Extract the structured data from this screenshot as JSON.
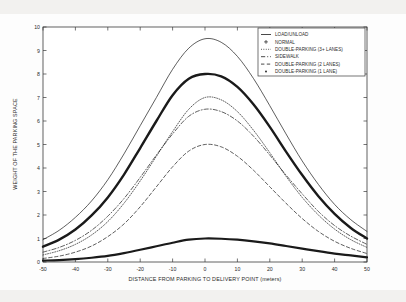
{
  "chart_data": {
    "type": "line",
    "title": "",
    "xlabel": "DISTANCE FROM PARKING TO DELIVERY POINT (meters)",
    "ylabel": "WEIGHT OF THE PARKING SPACE",
    "xlim": [
      -50,
      50
    ],
    "ylim": [
      0,
      10
    ],
    "xticks": [
      -50,
      -40,
      -30,
      -20,
      -10,
      0,
      10,
      20,
      30,
      40,
      50
    ],
    "yticks": [
      0,
      1,
      2,
      3,
      4,
      5,
      6,
      7,
      8,
      9,
      10
    ],
    "xtick_labels": [
      "-50",
      "-40",
      "-30",
      "-20",
      "-10",
      "0",
      "10",
      "20",
      "30",
      "40",
      "50"
    ],
    "ytick_labels": [
      "0",
      "1",
      "2",
      "3",
      "4",
      "5",
      "6",
      "7",
      "8",
      "9",
      "10"
    ],
    "grid": false,
    "legend_position": "top-right",
    "x": [
      -50,
      -45,
      -40,
      -35,
      -30,
      -25,
      -20,
      -15,
      -10,
      -5,
      0,
      5,
      10,
      15,
      20,
      25,
      30,
      35,
      40,
      45,
      50
    ],
    "series": [
      {
        "name": "LOAD/UNLOAD",
        "style": "solid",
        "linewidth": 0.7,
        "peak": 9.5,
        "values": [
          0.95,
          1.35,
          1.9,
          2.6,
          3.5,
          4.6,
          5.8,
          7.0,
          8.2,
          9.1,
          9.5,
          9.35,
          8.75,
          7.8,
          6.65,
          5.45,
          4.3,
          3.3,
          2.45,
          1.8,
          1.3
        ]
      },
      {
        "name": "NORMAL",
        "style": "solid",
        "linewidth": 2.2,
        "peak": 1.0,
        "values": [
          0.06,
          0.08,
          0.12,
          0.18,
          0.26,
          0.38,
          0.52,
          0.67,
          0.82,
          0.95,
          1.0,
          0.99,
          0.95,
          0.88,
          0.79,
          0.68,
          0.57,
          0.46,
          0.36,
          0.28,
          0.2
        ]
      },
      {
        "name": "DOUBLE-PARKING (3+ LANES)",
        "style": "dotted",
        "linewidth": 0.7,
        "peak": 7.0,
        "values": [
          0.3,
          0.48,
          0.75,
          1.15,
          1.72,
          2.5,
          3.45,
          4.5,
          5.55,
          6.5,
          7.0,
          6.9,
          6.4,
          5.6,
          4.65,
          3.65,
          2.75,
          2.0,
          1.4,
          0.95,
          0.62
        ]
      },
      {
        "name": "SIDEWALK",
        "style": "dashdot",
        "linewidth": 0.7,
        "peak": 6.5,
        "values": [
          0.42,
          0.62,
          0.92,
          1.35,
          1.95,
          2.7,
          3.6,
          4.55,
          5.45,
          6.2,
          6.5,
          6.4,
          6.0,
          5.35,
          4.55,
          3.7,
          2.9,
          2.15,
          1.55,
          1.1,
          0.75
        ]
      },
      {
        "name": "DOUBLE-PARKING (2 LANES)",
        "style": "dashed",
        "linewidth": 0.7,
        "peak": 5.0,
        "values": [
          0.15,
          0.25,
          0.42,
          0.68,
          1.08,
          1.62,
          2.35,
          3.2,
          4.05,
          4.72,
          5.0,
          4.9,
          4.5,
          3.9,
          3.2,
          2.5,
          1.85,
          1.3,
          0.88,
          0.58,
          0.36
        ]
      },
      {
        "name": "DOUBLE-PARKING (1 LANE)",
        "style": "solid-thick",
        "linewidth": 2.4,
        "peak": 8.0,
        "values": [
          0.65,
          0.95,
          1.38,
          1.98,
          2.75,
          3.72,
          4.85,
          6.0,
          7.1,
          7.8,
          8.0,
          7.9,
          7.45,
          6.7,
          5.75,
          4.7,
          3.7,
          2.8,
          2.05,
          1.45,
          1.0
        ]
      }
    ]
  },
  "legend": {
    "entries": [
      {
        "label": "LOAD/UNLOAD",
        "marker": "solid-line"
      },
      {
        "label": "NORMAL",
        "marker": "plus-marker"
      },
      {
        "label": "DOUBLE-PARKING (3+ LANES)",
        "marker": "dotted-line"
      },
      {
        "label": "SIDEWALK",
        "marker": "dashdot-line"
      },
      {
        "label": "DOUBLE-PARKING (2 LANES)",
        "marker": "dashed-line"
      },
      {
        "label": "DOUBLE-PARKING (1 LANE)",
        "marker": "dot-marker"
      }
    ]
  },
  "colors": {
    "ink": "#1a1a1a",
    "axis": "#3a3a3a",
    "background": "#ffffff"
  }
}
